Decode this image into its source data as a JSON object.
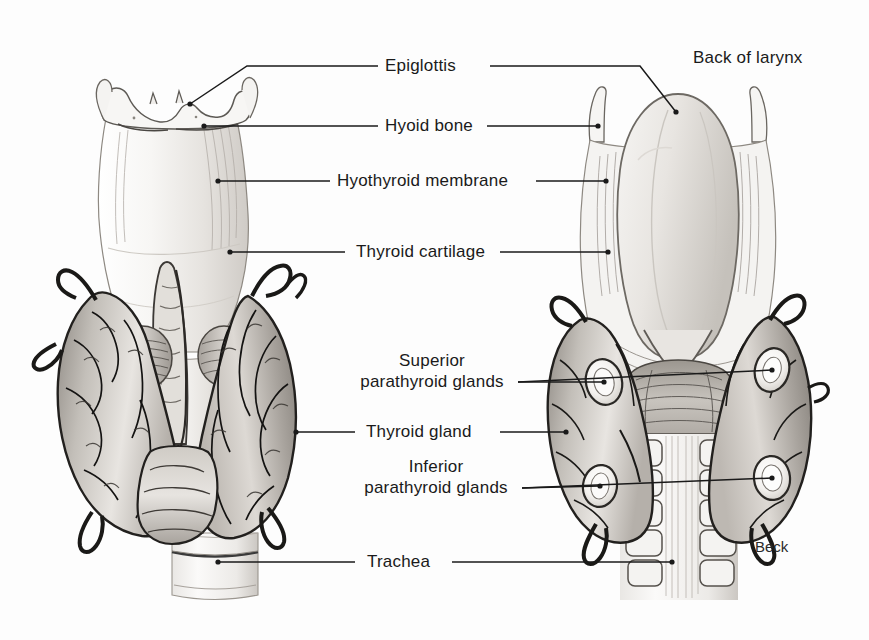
{
  "figure": {
    "signature": "Beck",
    "background_color": "#fdfdfd",
    "ink_color": "#1a1a1a",
    "style": "grayscale pencil and wash medical illustration"
  },
  "labels": {
    "epiglottis": "Epiglottis",
    "hyoid_bone": "Hyoid bone",
    "hyothyroid_membrane": "Hyothyroid membrane",
    "thyroid_cartilage": "Thyroid cartilage",
    "superior_parathyroid_line1": "Superior",
    "superior_parathyroid_line2": "parathyroid glands",
    "thyroid_gland": "Thyroid gland",
    "inferior_parathyroid_line1": "Inferior",
    "inferior_parathyroid_line2": "parathyroid glands",
    "trachea": "Trachea",
    "back_of_larynx": "Back of larynx"
  },
  "views": {
    "anterior": {
      "name": "Anterior view",
      "structures": [
        "epiglottis",
        "hyoid bone",
        "hyothyroid membrane",
        "thyroid cartilage",
        "cricothyroid muscle",
        "pyramidal lobe",
        "thyroid gland lobes",
        "isthmus",
        "trachea"
      ]
    },
    "posterior": {
      "name": "Posterior view (back of larynx)",
      "structures": [
        "epiglottis",
        "hyoid cornua",
        "pharyngeal constrictor",
        "superior parathyroid glands",
        "inferior parathyroid glands",
        "thyroid gland lobes",
        "tracheal rings",
        "oesophageal muscle"
      ]
    }
  },
  "palette": {
    "gland_mid": "#b9b4ae",
    "gland_dark": "#7d7872",
    "gland_light": "#e4e1dc",
    "cartilage": "#f2f0ed",
    "outline": "#2b2b2b",
    "vessel": "#1f1f1f"
  }
}
